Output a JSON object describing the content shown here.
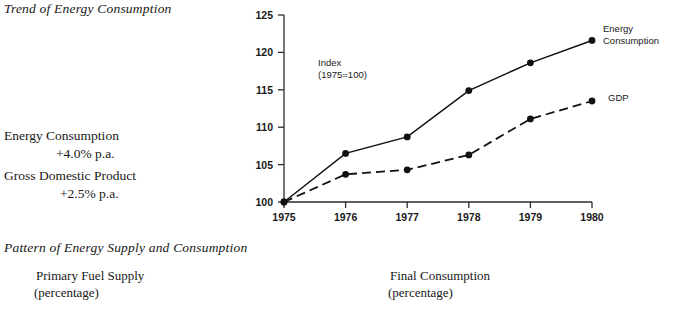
{
  "headings": {
    "trend": "Trend of Energy Consumption",
    "pattern": "Pattern of Energy Supply and Consumption"
  },
  "stats": [
    {
      "label": "Energy Consumption",
      "rate": "+4.0% p.a."
    },
    {
      "label": "Gross Domestic Product",
      "rate": "+2.5% p.a."
    }
  ],
  "captions": [
    {
      "title": "Primary Fuel Supply",
      "sub": "(percentage)"
    },
    {
      "title": "Final Consumption",
      "sub": "(percentage)"
    }
  ],
  "chart_data": {
    "type": "line",
    "title": "Trend of Energy Consumption",
    "annotation": "Index",
    "annotation_sub": "(1975=100)",
    "xlabel": "",
    "ylabel": "Index (1975=100)",
    "categories": [
      "1975",
      "1976",
      "1977",
      "1978",
      "1979",
      "1980"
    ],
    "x": [
      1975,
      1976,
      1977,
      1978,
      1979,
      1980
    ],
    "xlim": [
      1975,
      1980
    ],
    "ylim": [
      100,
      125
    ],
    "yticks": [
      100,
      105,
      110,
      115,
      120,
      125
    ],
    "ytick_labels": [
      "100",
      "105",
      "110",
      "115",
      "120",
      "125"
    ],
    "grid": false,
    "legend_position": "right-inline",
    "series": [
      {
        "name": "Energy Consumption",
        "style": "solid",
        "values": [
          100,
          106.5,
          108.7,
          114.9,
          118.6,
          121.6
        ]
      },
      {
        "name": "GDP",
        "style": "dashed",
        "values": [
          100,
          103.7,
          104.3,
          106.3,
          111.1,
          113.5
        ]
      }
    ]
  },
  "colors": {
    "ink": "#111111",
    "axis": "#2b2b2b",
    "background": "#ffffff"
  }
}
